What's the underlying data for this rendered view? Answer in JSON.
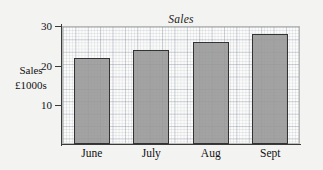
{
  "chart_data": {
    "type": "bar",
    "title": "Sales",
    "xlabel": "",
    "ylabel": "Sales £1000s",
    "ylabel_lines": [
      "Sales",
      "£1000s"
    ],
    "categories": [
      "June",
      "July",
      "Aug",
      "Sept"
    ],
    "values": [
      22,
      24,
      26,
      28
    ],
    "series": [
      {
        "name": "Sales",
        "values": [
          22,
          24,
          26,
          28
        ]
      }
    ],
    "ylim": [
      0,
      30
    ],
    "ytick_labels": [
      "10",
      "20",
      "30"
    ],
    "ytick_values": [
      10,
      20,
      30
    ],
    "grid": true,
    "grid_style": "graph-paper",
    "legend": "none",
    "bar_color": "#969696",
    "bar_edge_color": "#333333",
    "background_color": "#f3f3f1",
    "plot_background_color": "#fbfbfa"
  }
}
